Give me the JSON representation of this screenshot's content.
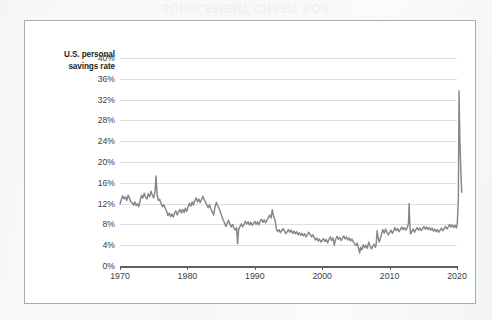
{
  "page": {
    "bleed_through_text": "SUPPLEMENT CHART BOX"
  },
  "figure": {
    "y_axis_title_line1": "U.S. personal",
    "y_axis_title_line2": "savings rate"
  },
  "colors": {
    "line": "#83878d",
    "gridline": "#dcdee0",
    "axis": "#5c6066",
    "frame": "#a9adb2",
    "text": "#3a3d42",
    "title_text": "#1d1f22",
    "plot_background": "#ffffff",
    "page_background": "#f6f7f8"
  },
  "chart_data": {
    "type": "line",
    "title": "",
    "subtitle": "",
    "xlabel": "",
    "ylabel": "U.S. personal savings rate",
    "grid": true,
    "legend_position": "none",
    "xlim": [
      1970,
      2020
    ],
    "ylim": [
      0,
      40
    ],
    "x_tick_labels": [
      "1970",
      "1980",
      "1990",
      "2000",
      "2010",
      "2020"
    ],
    "x_ticks": [
      1970,
      1980,
      1990,
      2000,
      2010,
      2020
    ],
    "y_tick_labels": [
      "0%",
      "4%",
      "8%",
      "12%",
      "16%",
      "20%",
      "24%",
      "28%",
      "32%",
      "36%",
      "40%"
    ],
    "y_ticks": [
      0,
      4,
      8,
      12,
      16,
      20,
      24,
      28,
      32,
      36,
      40
    ],
    "y_unit": "%",
    "annotations": [
      {
        "label": "1975 tax-rebate spike",
        "x": 1975.4,
        "y": 17.3
      },
      {
        "label": "1987 trough",
        "x": 1987.5,
        "y": 4.3
      },
      {
        "label": "2005 record low",
        "x": 2005.6,
        "y": 2.5
      },
      {
        "label": "2012 year-end spike",
        "x": 2012.9,
        "y": 12.0
      },
      {
        "label": "2020 pandemic spike",
        "x": 2020.3,
        "y": 33.7
      }
    ],
    "series": [
      {
        "name": "U.S. personal savings rate",
        "color": "#83878d",
        "x": [
          1970.0,
          1970.2,
          1970.4,
          1970.6,
          1970.8,
          1971.0,
          1971.2,
          1971.4,
          1971.6,
          1971.8,
          1972.0,
          1972.2,
          1972.4,
          1972.6,
          1972.8,
          1973.0,
          1973.2,
          1973.4,
          1973.6,
          1973.8,
          1974.0,
          1974.2,
          1974.4,
          1974.6,
          1974.8,
          1975.0,
          1975.2,
          1975.35,
          1975.5,
          1975.7,
          1975.9,
          1976.1,
          1976.3,
          1976.5,
          1976.7,
          1976.9,
          1977.1,
          1977.3,
          1977.5,
          1977.7,
          1977.9,
          1978.1,
          1978.3,
          1978.5,
          1978.7,
          1978.9,
          1979.1,
          1979.3,
          1979.5,
          1979.7,
          1979.9,
          1980.1,
          1980.3,
          1980.5,
          1980.7,
          1980.9,
          1981.1,
          1981.3,
          1981.5,
          1981.7,
          1981.9,
          1982.1,
          1982.3,
          1982.5,
          1982.7,
          1982.9,
          1983.1,
          1983.3,
          1983.5,
          1983.7,
          1983.9,
          1984.1,
          1984.3,
          1984.5,
          1984.7,
          1984.9,
          1985.1,
          1985.3,
          1985.5,
          1985.7,
          1985.9,
          1986.1,
          1986.3,
          1986.5,
          1986.7,
          1986.9,
          1987.1,
          1987.3,
          1987.45,
          1987.6,
          1987.8,
          1988.0,
          1988.2,
          1988.4,
          1988.6,
          1988.8,
          1989.0,
          1989.2,
          1989.4,
          1989.6,
          1989.8,
          1990.0,
          1990.2,
          1990.4,
          1990.6,
          1990.8,
          1991.0,
          1991.2,
          1991.4,
          1991.6,
          1991.8,
          1992.0,
          1992.2,
          1992.4,
          1992.6,
          1992.8,
          1993.0,
          1993.2,
          1993.4,
          1993.6,
          1993.8,
          1994.0,
          1994.2,
          1994.4,
          1994.6,
          1994.8,
          1995.0,
          1995.2,
          1995.4,
          1995.6,
          1995.8,
          1996.0,
          1996.2,
          1996.4,
          1996.6,
          1996.8,
          1997.0,
          1997.2,
          1997.4,
          1997.6,
          1997.8,
          1998.0,
          1998.2,
          1998.4,
          1998.6,
          1998.8,
          1999.0,
          1999.2,
          1999.4,
          1999.6,
          1999.8,
          2000.0,
          2000.2,
          2000.4,
          2000.6,
          2000.8,
          2001.0,
          2001.2,
          2001.4,
          2001.6,
          2001.8,
          2002.0,
          2002.2,
          2002.4,
          2002.6,
          2002.8,
          2003.0,
          2003.2,
          2003.4,
          2003.6,
          2003.8,
          2004.0,
          2004.2,
          2004.4,
          2004.6,
          2004.8,
          2005.0,
          2005.2,
          2005.4,
          2005.55,
          2005.7,
          2005.9,
          2006.1,
          2006.3,
          2006.5,
          2006.7,
          2006.9,
          2007.1,
          2007.3,
          2007.5,
          2007.7,
          2007.9,
          2008.0,
          2008.15,
          2008.3,
          2008.45,
          2008.6,
          2008.8,
          2009.0,
          2009.2,
          2009.4,
          2009.6,
          2009.8,
          2010.0,
          2010.2,
          2010.4,
          2010.6,
          2010.8,
          2011.0,
          2011.2,
          2011.4,
          2011.6,
          2011.8,
          2012.0,
          2012.2,
          2012.4,
          2012.6,
          2012.8,
          2012.9,
          2013.0,
          2013.1,
          2013.3,
          2013.5,
          2013.7,
          2013.9,
          2014.1,
          2014.3,
          2014.5,
          2014.7,
          2014.9,
          2015.1,
          2015.3,
          2015.5,
          2015.7,
          2015.9,
          2016.1,
          2016.3,
          2016.5,
          2016.7,
          2016.9,
          2017.1,
          2017.3,
          2017.5,
          2017.7,
          2017.9,
          2018.1,
          2018.3,
          2018.5,
          2018.7,
          2018.9,
          2019.1,
          2019.3,
          2019.5,
          2019.7,
          2019.9,
          2020.05,
          2020.2,
          2020.3,
          2020.42,
          2020.55,
          2020.7
        ],
        "values": [
          11.9,
          12.8,
          13.5,
          12.9,
          13.3,
          12.6,
          13.6,
          13.1,
          12.3,
          12.2,
          11.7,
          12.3,
          11.6,
          12.0,
          11.4,
          12.6,
          13.6,
          13.1,
          14.0,
          13.2,
          12.9,
          13.9,
          13.3,
          14.4,
          13.6,
          13.1,
          14.3,
          17.3,
          13.8,
          12.6,
          12.8,
          12.0,
          11.4,
          11.8,
          11.1,
          10.6,
          9.7,
          10.2,
          9.5,
          10.0,
          9.4,
          10.2,
          10.6,
          9.8,
          10.4,
          10.9,
          10.2,
          10.9,
          10.3,
          11.1,
          10.5,
          11.4,
          12.1,
          11.5,
          12.3,
          11.7,
          12.6,
          13.1,
          12.3,
          12.9,
          12.2,
          12.8,
          13.4,
          12.7,
          12.3,
          11.7,
          11.2,
          11.8,
          10.9,
          10.4,
          9.8,
          11.4,
          12.2,
          11.6,
          11.0,
          10.4,
          9.6,
          8.9,
          8.3,
          7.6,
          8.2,
          8.8,
          8.1,
          7.5,
          8.0,
          7.3,
          6.9,
          7.4,
          4.3,
          7.0,
          7.6,
          8.1,
          7.5,
          8.0,
          8.6,
          8.1,
          8.5,
          7.9,
          8.4,
          7.8,
          8.2,
          8.6,
          8.0,
          8.5,
          7.9,
          8.6,
          9.0,
          8.4,
          8.9,
          8.3,
          8.8,
          9.3,
          9.8,
          9.2,
          10.8,
          9.5,
          8.9,
          7.1,
          6.6,
          7.0,
          6.4,
          6.8,
          7.2,
          6.7,
          6.2,
          6.6,
          7.0,
          6.5,
          6.9,
          6.3,
          6.7,
          6.2,
          6.6,
          6.0,
          6.4,
          5.9,
          6.3,
          5.8,
          6.2,
          5.6,
          6.0,
          6.5,
          6.1,
          5.6,
          6.0,
          5.5,
          5.0,
          5.4,
          4.8,
          5.2,
          4.6,
          4.9,
          5.3,
          4.7,
          5.1,
          4.4,
          5.1,
          5.6,
          4.9,
          5.4,
          4.0,
          5.2,
          5.7,
          5.1,
          5.5,
          4.9,
          5.3,
          5.8,
          5.2,
          5.6,
          5.0,
          5.4,
          4.8,
          5.2,
          4.7,
          4.3,
          3.9,
          4.4,
          3.4,
          2.5,
          3.6,
          3.1,
          4.1,
          3.5,
          4.0,
          3.4,
          4.6,
          3.9,
          3.3,
          3.7,
          4.2,
          3.6,
          4.1,
          6.8,
          5.4,
          4.6,
          5.2,
          6.1,
          7.0,
          6.3,
          7.1,
          6.5,
          6.0,
          6.4,
          6.9,
          6.3,
          6.7,
          7.4,
          6.8,
          7.2,
          6.6,
          7.0,
          7.5,
          7.0,
          7.4,
          6.9,
          7.3,
          8.2,
          12.0,
          7.8,
          6.2,
          6.6,
          7.1,
          6.5,
          7.0,
          7.4,
          6.9,
          7.3,
          6.8,
          7.2,
          7.6,
          7.1,
          7.5,
          7.0,
          7.4,
          6.9,
          7.3,
          6.7,
          7.1,
          6.6,
          7.0,
          6.5,
          6.9,
          7.3,
          6.8,
          7.2,
          7.6,
          7.1,
          7.5,
          8.0,
          7.5,
          7.9,
          7.4,
          7.8,
          7.3,
          8.3,
          12.9,
          33.7,
          24.6,
          19.0,
          14.2
        ]
      }
    ]
  }
}
